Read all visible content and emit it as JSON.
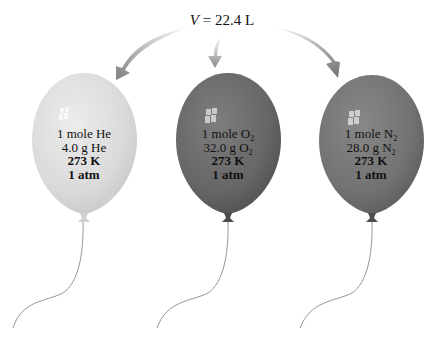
{
  "header": {
    "volume_variable": "V",
    "volume_equals": " = 22.4 L"
  },
  "arrows": [
    {
      "target": "He",
      "color": "#8a8a8a"
    },
    {
      "target": "O2",
      "color": "#8a8a8a"
    },
    {
      "target": "N2",
      "color": "#8a8a8a"
    }
  ],
  "balloons": [
    {
      "gas": "He",
      "color": "#dcdcdc",
      "line1_prefix": "1 mole He",
      "line1_sub": "",
      "line2_prefix": "4.0 g He",
      "line2_sub": "",
      "temperature": "273 K",
      "pressure": "1 atm"
    },
    {
      "gas": "O2",
      "color": "#6a6a6a",
      "line1_prefix": "1 mole O",
      "line1_sub": "2",
      "line2_prefix": "32.0 g O",
      "line2_sub": "2",
      "temperature": "273 K",
      "pressure": "1 atm"
    },
    {
      "gas": "N2",
      "color": "#757575",
      "line1_prefix": "1 mole N",
      "line1_sub": "2",
      "line2_prefix": "28.0 g N",
      "line2_sub": "2",
      "temperature": "273 K",
      "pressure": "1 atm"
    }
  ]
}
